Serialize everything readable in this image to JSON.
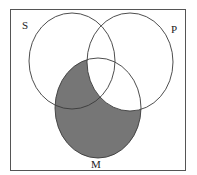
{
  "diagram": {
    "type": "venn",
    "frame": {
      "x": 10,
      "y": 9,
      "width": 175,
      "height": 161,
      "stroke": "#555555"
    },
    "sets": [
      {
        "id": "S",
        "label": "S",
        "cx": 72,
        "cy": 61,
        "rx": 43,
        "ry": 48,
        "label_x": 22,
        "label_y": 29
      },
      {
        "id": "P",
        "label": "P",
        "cx": 130,
        "cy": 62,
        "rx": 43,
        "ry": 49,
        "label_x": 171,
        "label_y": 33
      },
      {
        "id": "M",
        "label": "M",
        "cx": 98,
        "cy": 108,
        "rx": 43,
        "ry": 50,
        "label_x": 91,
        "label_y": 168
      }
    ],
    "shaded_region": "M minus P",
    "colors": {
      "shade": "#767676",
      "stroke": "#3a3a3a",
      "background": "#ffffff"
    }
  }
}
